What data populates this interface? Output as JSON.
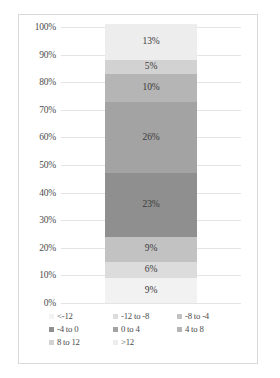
{
  "chart_data": {
    "type": "bar",
    "subtype": "100% stacked column",
    "title": "",
    "xlabel": "",
    "ylabel": "",
    "ylim": [
      0,
      100
    ],
    "y_ticks": [
      "0%",
      "10%",
      "20%",
      "30%",
      "40%",
      "50%",
      "60%",
      "70%",
      "80%",
      "90%",
      "100%"
    ],
    "grid": true,
    "legend_position": "bottom",
    "categories": [
      ""
    ],
    "series": [
      {
        "name": "<-12",
        "values": [
          9
        ],
        "label": "9%",
        "color": "#f2f2f2",
        "pattern": "solid"
      },
      {
        "name": "-12 to -8",
        "values": [
          6
        ],
        "label": "6%",
        "color": "#dcdcdc",
        "pattern": "solid"
      },
      {
        "name": "-8 to -4",
        "values": [
          9
        ],
        "label": "9%",
        "color": "#c2c2c2",
        "pattern": "solid"
      },
      {
        "name": "-4 to 0",
        "values": [
          23
        ],
        "label": "23%",
        "color": "#8f8f8f",
        "pattern": "dotted"
      },
      {
        "name": "0 to 4",
        "values": [
          26
        ],
        "label": "26%",
        "color": "#a3a3a3",
        "pattern": "solid"
      },
      {
        "name": "4 to 8",
        "values": [
          10
        ],
        "label": "10%",
        "color": "#b5b5b5",
        "pattern": "solid"
      },
      {
        "name": "8 to 12",
        "values": [
          5
        ],
        "label": "5%",
        "color": "#d2d2d2",
        "pattern": "solid"
      },
      {
        "name": ">12",
        "values": [
          13
        ],
        "label": "13%",
        "color": "#ededed",
        "pattern": "solid"
      }
    ]
  },
  "legend": {
    "items": [
      {
        "label": "<-12"
      },
      {
        "label": "-12 to -8"
      },
      {
        "label": "-8 to -4"
      },
      {
        "label": "-4 to 0"
      },
      {
        "label": "0 to 4"
      },
      {
        "label": "4 to 8"
      },
      {
        "label": "8 to 12"
      },
      {
        "label": ">12"
      }
    ]
  }
}
